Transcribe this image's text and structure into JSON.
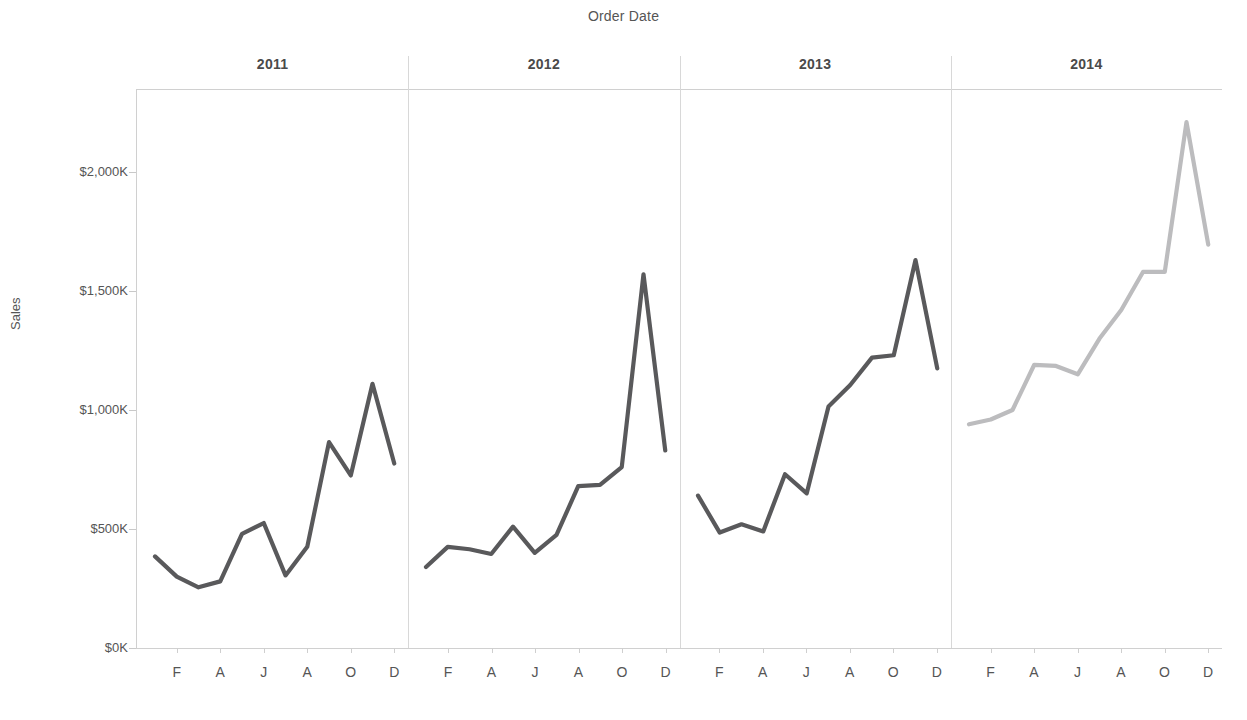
{
  "header": {
    "column_title": "Order Date"
  },
  "axes": {
    "y_title": "Sales",
    "y_ticks": [
      "$0K",
      "$500K",
      "$1,000K",
      "$1,500K",
      "$2,000K"
    ],
    "y_tick_values": [
      0,
      500,
      1000,
      1500,
      2000
    ],
    "x_ticks": [
      "F",
      "A",
      "J",
      "A",
      "O",
      "D"
    ],
    "x_tick_months": [
      2,
      4,
      6,
      8,
      10,
      12
    ]
  },
  "colors": {
    "line_dark": "#59595b",
    "line_light": "#bcbcbe",
    "axis": "#d0d0d0",
    "divider": "#d8d8d8",
    "text": "#555555"
  },
  "panels": [
    {
      "label": "2011",
      "color_key": "line_dark"
    },
    {
      "label": "2012",
      "color_key": "line_dark"
    },
    {
      "label": "2013",
      "color_key": "line_dark"
    },
    {
      "label": "2014",
      "color_key": "line_light"
    }
  ],
  "chart_data": {
    "type": "line",
    "title": "Order Date",
    "xlabel": "Order Date",
    "ylabel": "Sales",
    "ylim": [
      0,
      2300
    ],
    "y_unit": "K",
    "grid": false,
    "legend": "none",
    "facet_by": "year",
    "x": [
      1,
      2,
      3,
      4,
      5,
      6,
      7,
      8,
      9,
      10,
      11,
      12
    ],
    "x_tick_labels": [
      "F",
      "A",
      "J",
      "A",
      "O",
      "D"
    ],
    "series": [
      {
        "name": "2011",
        "color": "#59595b",
        "values": [
          385,
          300,
          255,
          280,
          480,
          525,
          305,
          425,
          865,
          725,
          1110,
          775
        ]
      },
      {
        "name": "2012",
        "color": "#59595b",
        "values": [
          340,
          425,
          415,
          395,
          510,
          400,
          475,
          680,
          685,
          760,
          1570,
          830
        ]
      },
      {
        "name": "2013",
        "color": "#59595b",
        "values": [
          640,
          485,
          520,
          490,
          730,
          650,
          1015,
          1105,
          1220,
          1230,
          1630,
          1175
        ]
      },
      {
        "name": "2014",
        "color": "#bcbcbe",
        "values": [
          940,
          960,
          1000,
          1190,
          1185,
          1150,
          1300,
          1420,
          1580,
          1580,
          2210,
          1695
        ]
      }
    ]
  }
}
